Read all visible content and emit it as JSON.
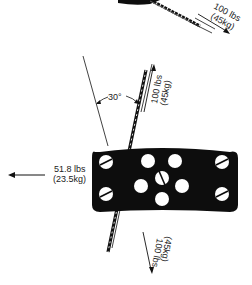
{
  "diagram": {
    "colors": {
      "ink": "#111111",
      "plate": "#0d0d0d",
      "hole": "#ffffff",
      "text": "#222222"
    },
    "labels": {
      "top_force_line1": "100 lbs",
      "top_force_line2": "(45kg)",
      "upper_force_line1": "100 lbs",
      "upper_force_line2": "(45kg)",
      "lower_force_line1": "100 lbs",
      "lower_force_line2": "(45kg)",
      "side_force_line1": "51.8 lbs",
      "side_force_line2": "(23.5kg)",
      "angle": "30°"
    },
    "plate": {
      "screw_count": 5,
      "hole_count": 5
    }
  }
}
